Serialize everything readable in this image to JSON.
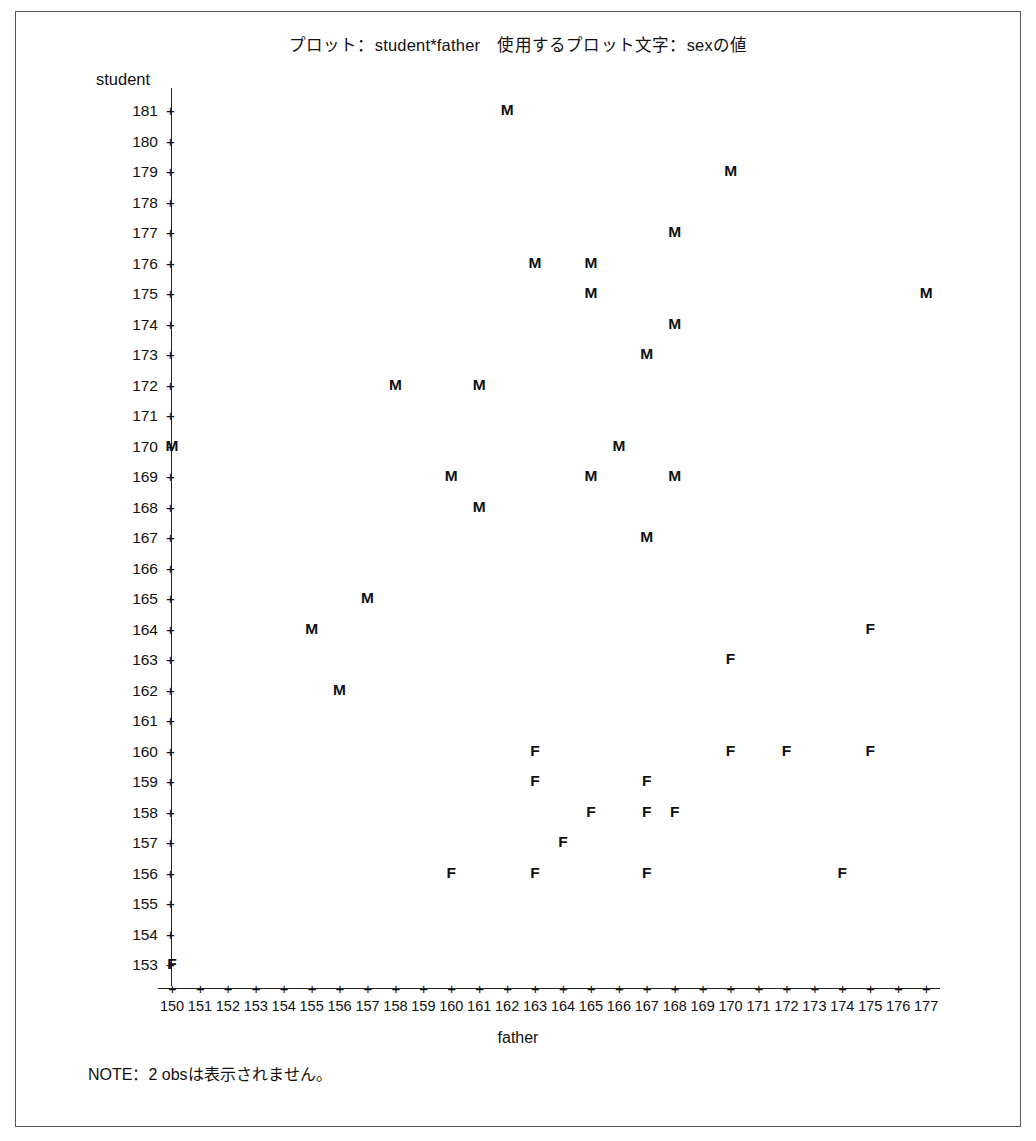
{
  "title": "プロット：student*father　使用するプロット文字：sexの値",
  "note": "NOTE：2 obsは表示されません。",
  "axis": {
    "y_label": "student",
    "x_label": "father"
  },
  "chart_data": {
    "type": "scatter",
    "title": "プロット：student*father　使用するプロット文字：sexの値",
    "xlabel": "father",
    "ylabel": "student",
    "xlim": [
      150,
      177
    ],
    "ylim": [
      153,
      181
    ],
    "grid": false,
    "legend": "none",
    "plot_symbol_variable": "sex",
    "annotation": "NOTE：2 obsは表示されません。",
    "x_ticks": [
      150,
      151,
      152,
      153,
      154,
      155,
      156,
      157,
      158,
      159,
      160,
      161,
      162,
      163,
      164,
      165,
      166,
      167,
      168,
      169,
      170,
      171,
      172,
      173,
      174,
      175,
      176,
      177
    ],
    "y_ticks": [
      181,
      180,
      179,
      178,
      177,
      176,
      175,
      174,
      173,
      172,
      171,
      170,
      169,
      168,
      167,
      166,
      165,
      164,
      163,
      162,
      161,
      160,
      159,
      158,
      157,
      156,
      155,
      154,
      153
    ],
    "series": [
      {
        "name": "M",
        "marker": "M",
        "points": [
          {
            "x": 162,
            "y": 181
          },
          {
            "x": 170,
            "y": 179
          },
          {
            "x": 168,
            "y": 177
          },
          {
            "x": 163,
            "y": 176
          },
          {
            "x": 165,
            "y": 176
          },
          {
            "x": 165,
            "y": 175
          },
          {
            "x": 177,
            "y": 175
          },
          {
            "x": 168,
            "y": 174
          },
          {
            "x": 167,
            "y": 173
          },
          {
            "x": 158,
            "y": 172
          },
          {
            "x": 161,
            "y": 172
          },
          {
            "x": 150,
            "y": 170
          },
          {
            "x": 166,
            "y": 170
          },
          {
            "x": 160,
            "y": 169
          },
          {
            "x": 165,
            "y": 169
          },
          {
            "x": 168,
            "y": 169
          },
          {
            "x": 161,
            "y": 168
          },
          {
            "x": 167,
            "y": 167
          },
          {
            "x": 157,
            "y": 165
          },
          {
            "x": 155,
            "y": 164
          },
          {
            "x": 156,
            "y": 162
          }
        ]
      },
      {
        "name": "F",
        "marker": "F",
        "points": [
          {
            "x": 175,
            "y": 164
          },
          {
            "x": 170,
            "y": 163
          },
          {
            "x": 163,
            "y": 160
          },
          {
            "x": 170,
            "y": 160
          },
          {
            "x": 172,
            "y": 160
          },
          {
            "x": 175,
            "y": 160
          },
          {
            "x": 163,
            "y": 159
          },
          {
            "x": 167,
            "y": 159
          },
          {
            "x": 165,
            "y": 158
          },
          {
            "x": 167,
            "y": 158
          },
          {
            "x": 168,
            "y": 158
          },
          {
            "x": 164,
            "y": 157
          },
          {
            "x": 160,
            "y": 156
          },
          {
            "x": 163,
            "y": 156
          },
          {
            "x": 167,
            "y": 156
          },
          {
            "x": 174,
            "y": 156
          },
          {
            "x": 150,
            "y": 153
          }
        ]
      }
    ]
  }
}
